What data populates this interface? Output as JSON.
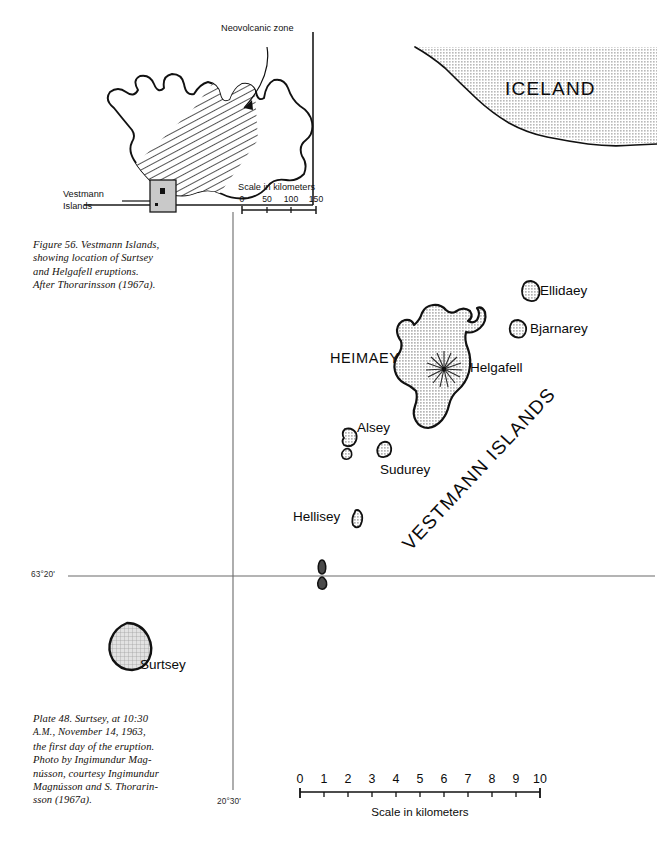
{
  "figure": {
    "caption_lines": [
      "Figure 56. Vestmann Islands,",
      "showing location of Surtsey",
      "and Helgafell eruptions.",
      "After Thorarinsson (1967a)."
    ]
  },
  "plate": {
    "caption_line1": "Plate 48. Surtsey, at 10:30",
    "caption_sc": "A.M.",
    "caption_line2_rest": ", November 14, 1963,",
    "caption_lines_rest": [
      "the first day of the eruption.",
      "Photo by Ingimundur Mag-",
      "nússon, courtesy Ingimundur",
      "Magnússon and S. Thorarin-",
      "sson (1967a)."
    ]
  },
  "inset": {
    "annotation": "Neovolcanic zone",
    "locator_label_line1": "Vestmann",
    "locator_label_line2": "Islands",
    "scale_title": "Scale in kilometers",
    "scale_ticks": [
      "0",
      "50",
      "100",
      "150"
    ],
    "hatch_legend_name": "neovolcanic-zone-hatching"
  },
  "iceland_inset": {
    "name": "ICELAND"
  },
  "main_map": {
    "islands": [
      {
        "name": "Ellidaey"
      },
      {
        "name": "Bjarnarey"
      },
      {
        "name": "HEIMAEY"
      },
      {
        "name": "Helgafell"
      },
      {
        "name": "Alsey"
      },
      {
        "name": "Sudurey"
      },
      {
        "name": "Hellisey"
      },
      {
        "name": "Surtsey"
      }
    ],
    "group_label": "VESTMANN ISLANDS",
    "latitude_label": "63°20'",
    "longitude_label": "20°30'",
    "scale_title": "Scale in kilometers",
    "scale_ticks": [
      "0",
      "1",
      "2",
      "3",
      "4",
      "5",
      "6",
      "7",
      "8",
      "9",
      "10"
    ]
  },
  "colors": {
    "land_fill": "#d3d3d3",
    "outline": "#111111",
    "graticule": "#6b6b6b",
    "text": "#0b0b0b"
  }
}
